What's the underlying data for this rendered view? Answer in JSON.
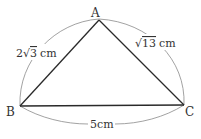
{
  "figure": {
    "type": "triangle",
    "vertices": {
      "A": {
        "label": "A"
      },
      "B": {
        "label": "B"
      },
      "C": {
        "label": "C"
      }
    },
    "sides": {
      "AB": {
        "coef": "2",
        "radicand": "3",
        "unit": "cm"
      },
      "AC": {
        "coef": "",
        "radicand": "13",
        "unit": "cm"
      },
      "BC": {
        "value": "5cm"
      }
    },
    "colors": {
      "edge": "#2a2a2a",
      "arc": "#8a8a8a",
      "text": "#333333"
    }
  }
}
